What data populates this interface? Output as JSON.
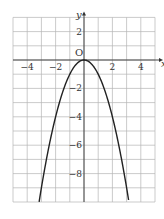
{
  "chart_data": {
    "type": "line",
    "title": "",
    "function": "y = -x^2",
    "xlabel": "x",
    "ylabel": "y",
    "origin_label": "O",
    "xlim": [
      -5,
      5
    ],
    "ylim": [
      -10,
      3
    ],
    "grid": true,
    "grid_step": 1,
    "x_ticks": [
      -4,
      -2,
      2,
      4
    ],
    "x_tick_labels": [
      "−4",
      "−2",
      "2",
      "4"
    ],
    "y_ticks": [
      2,
      -2,
      -4,
      -6,
      -8
    ],
    "y_tick_labels": [
      "2",
      "−2",
      "−4",
      "−6",
      "−8"
    ],
    "series": [
      {
        "name": "y = -x^2",
        "x": [
          -3.16,
          -3,
          -2.5,
          -2,
          -1.5,
          -1,
          -0.5,
          0,
          0.5,
          1,
          1.5,
          2,
          2.5,
          3,
          3.16
        ],
        "y": [
          -10,
          -9,
          -6.25,
          -4,
          -2.25,
          -1,
          -0.25,
          0,
          -0.25,
          -1,
          -2.25,
          -4,
          -6.25,
          -9,
          -10
        ]
      }
    ],
    "colors": {
      "grid": "#b5b5b5",
      "axis": "#333333",
      "curve": "#222222"
    }
  }
}
